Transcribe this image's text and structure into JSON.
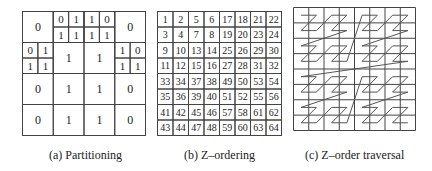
{
  "figure": {
    "partitioning": {
      "caption": "(a) Partitioning",
      "grid": [
        [
          {
            "value": "0"
          },
          {
            "sub": [
              "0",
              "1",
              "1",
              "1"
            ]
          },
          {
            "sub": [
              "1",
              "0",
              "1",
              "1"
            ]
          },
          {
            "value": "0"
          }
        ],
        [
          {
            "sub": [
              "0",
              "1",
              "1",
              "1"
            ]
          },
          {
            "value": "1"
          },
          {
            "value": "1"
          },
          {
            "sub": [
              "1",
              "0",
              "1",
              "1"
            ]
          }
        ],
        [
          {
            "value": "0"
          },
          {
            "value": "1"
          },
          {
            "value": "1"
          },
          {
            "value": "0"
          }
        ],
        [
          {
            "value": "0"
          },
          {
            "value": "1"
          },
          {
            "value": "1"
          },
          {
            "value": "0"
          }
        ]
      ]
    },
    "z_ordering": {
      "caption": "(b) Z–ordering",
      "grid": [
        [
          1,
          2,
          5,
          6,
          17,
          18,
          21,
          22
        ],
        [
          3,
          4,
          7,
          8,
          19,
          20,
          23,
          24
        ],
        [
          9,
          10,
          13,
          14,
          25,
          26,
          29,
          30
        ],
        [
          11,
          12,
          15,
          16,
          27,
          28,
          31,
          32
        ],
        [
          33,
          34,
          37,
          38,
          49,
          50,
          53,
          54
        ],
        [
          35,
          36,
          39,
          40,
          51,
          52,
          55,
          56
        ],
        [
          41,
          42,
          45,
          46,
          57,
          58,
          61,
          62
        ],
        [
          43,
          44,
          47,
          48,
          59,
          60,
          63,
          64
        ]
      ]
    },
    "z_traversal": {
      "caption": "(c) Z–order traversal",
      "grid_size": 8
    }
  }
}
